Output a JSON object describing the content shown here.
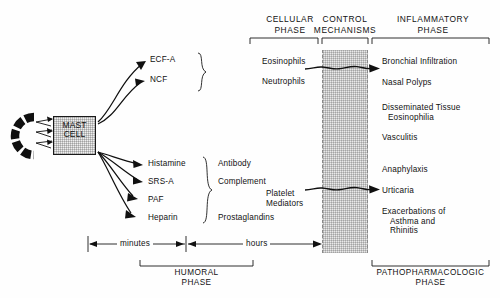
{
  "figure": {
    "columns": [
      {
        "id": "cellular",
        "title_line1": "CELLULAR",
        "title_line2": "PHASE"
      },
      {
        "id": "control",
        "title_line1": "CONTROL",
        "title_line2": "MECHANISMS"
      },
      {
        "id": "inflammatory",
        "title_line1": "INFLAMMATORY",
        "title_line2": "PHASE"
      }
    ],
    "source": {
      "label_line1": "MAST",
      "label_line2": "CELL",
      "trigger_icon": "antigen-antibody-icon"
    },
    "mediators_upper": [
      {
        "label": "ECF-A"
      },
      {
        "label": "NCF"
      }
    ],
    "mediators_lower": [
      {
        "label": "Histamine"
      },
      {
        "label": "SRS-A"
      },
      {
        "label": "PAF"
      },
      {
        "label": "Heparin"
      }
    ],
    "amplifiers": [
      {
        "label": "Antibody"
      },
      {
        "label": "Complement"
      },
      {
        "label": "Prostaglandins"
      }
    ],
    "cellular_items": [
      {
        "label": "Eosinophils"
      },
      {
        "label": "Neutrophils"
      },
      {
        "label": "Platelet\nMediators",
        "line1": "Platelet",
        "line2": "Mediators"
      }
    ],
    "inflammatory_items": [
      {
        "line1": "Bronchial Infiltration",
        "line2": ""
      },
      {
        "line1": "Nasal Polyps",
        "line2": ""
      },
      {
        "line1": "Disseminated Tissue",
        "line2": "Eosinophilia"
      },
      {
        "line1": "Vasculitis",
        "line2": ""
      },
      {
        "line1": "Anaphylaxis",
        "line2": ""
      },
      {
        "line1": "Urticaria",
        "line2": ""
      },
      {
        "line1": "Exacerbations of",
        "line2": "Asthma  and",
        "line3": "Rhinitis"
      }
    ],
    "timeline": {
      "left_label": "minutes",
      "right_label": "hours"
    },
    "phases": [
      {
        "id": "humoral",
        "line1": "HUMORAL",
        "line2": "PHASE"
      },
      {
        "id": "pathopharmacologic",
        "line1": "PATHOPHARMACOLOGIC",
        "line2": "PHASE"
      }
    ],
    "colors": {
      "ink": "#111111",
      "shade": "#e9e9e9",
      "rule": "#1a1a1a"
    }
  }
}
